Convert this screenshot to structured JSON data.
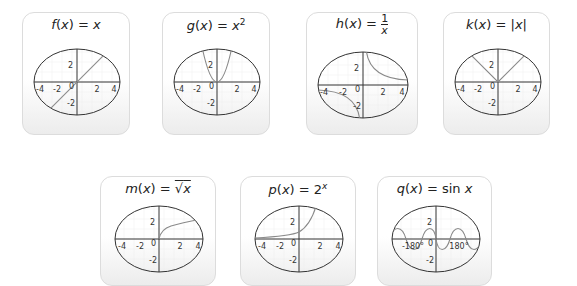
{
  "cards": [
    {
      "id": "f",
      "name": "f",
      "expr": "x",
      "label": "f(x) = x"
    },
    {
      "id": "g",
      "name": "g",
      "expr": "x²",
      "label": "g(x) = x²"
    },
    {
      "id": "h",
      "name": "h",
      "expr": "1/x",
      "label": "h(x) = 1/x"
    },
    {
      "id": "k",
      "name": "k",
      "expr": "|x|",
      "label": "k(x) = |x|"
    },
    {
      "id": "m",
      "name": "m",
      "expr": "√x",
      "label": "m(x) = √x"
    },
    {
      "id": "p",
      "name": "p",
      "expr": "2ˣ",
      "label": "p(x) = 2ˣ"
    },
    {
      "id": "q",
      "name": "q",
      "expr": "sin x",
      "label": "q(x) = sin x"
    }
  ],
  "axis_ticks": {
    "x": [
      "-4",
      "-2",
      "0",
      "2",
      "4"
    ],
    "y": [
      "2",
      "-2"
    ],
    "sin_x": [
      "-180°",
      "0",
      "180°"
    ]
  },
  "colors": {
    "curve": "#8a8a8a",
    "axis": "#333333",
    "grid": "#e6e6e6",
    "card_border": "#dcdcdc"
  }
}
